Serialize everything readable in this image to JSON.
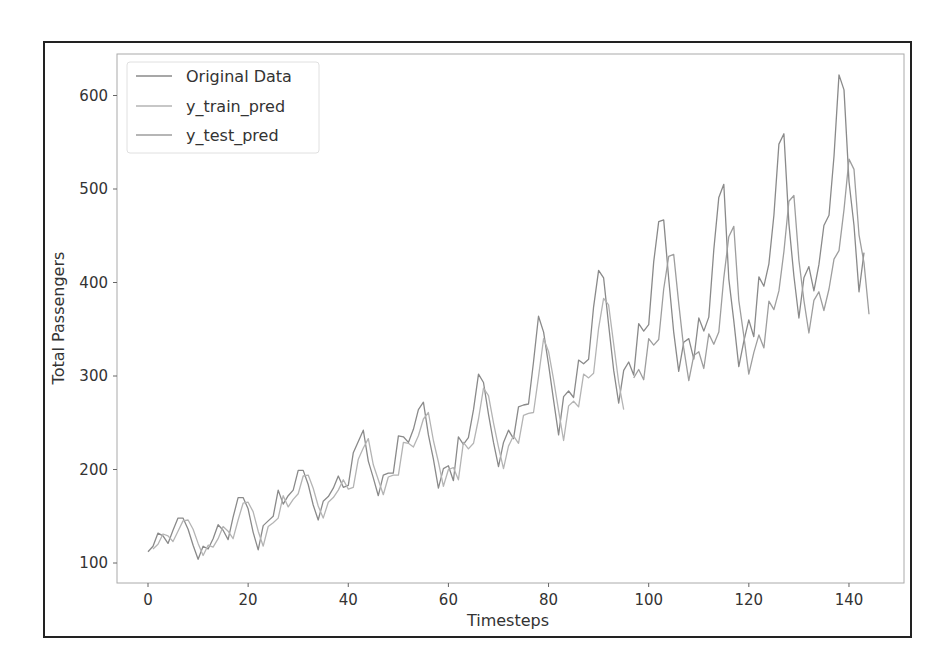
{
  "chart_data": {
    "type": "line",
    "title": "",
    "xlabel": "Timesteps",
    "ylabel": "Total Passengers",
    "xlim": [
      -7.5,
      151
    ],
    "ylim": [
      75,
      645
    ],
    "xticks": [
      0,
      20,
      40,
      60,
      80,
      100,
      120,
      140
    ],
    "yticks": [
      100,
      200,
      300,
      400,
      500,
      600
    ],
    "grid": false,
    "legend_position": "upper left",
    "legend": [
      "Original Data",
      "y_train_pred",
      "y_test_pred"
    ],
    "series": [
      {
        "name": "Original Data",
        "color": "#8a8a8a",
        "x_start": 0,
        "values": [
          112,
          118,
          132,
          129,
          121,
          135,
          148,
          148,
          136,
          119,
          104,
          118,
          115,
          126,
          141,
          135,
          125,
          149,
          170,
          170,
          158,
          133,
          114,
          140,
          145,
          150,
          178,
          163,
          172,
          178,
          199,
          199,
          184,
          162,
          146,
          166,
          171,
          180,
          193,
          181,
          183,
          218,
          230,
          242,
          209,
          191,
          172,
          194,
          196,
          196,
          236,
          235,
          229,
          243,
          264,
          272,
          237,
          211,
          180,
          201,
          204,
          188,
          235,
          227,
          234,
          264,
          302,
          293,
          259,
          229,
          203,
          229,
          242,
          233,
          267,
          269,
          270,
          315,
          364,
          347,
          312,
          274,
          237,
          278,
          284,
          277,
          317,
          313,
          318,
          374,
          413,
          405,
          355,
          306,
          271,
          306,
          315,
          301,
          356,
          348,
          355,
          422,
          465,
          467,
          404,
          347,
          305,
          336,
          340,
          318,
          362,
          348,
          363,
          435,
          491,
          505,
          404,
          359,
          310,
          337,
          360,
          342,
          406,
          396,
          420,
          472,
          548,
          559,
          463,
          407,
          362,
          405,
          417,
          391,
          419,
          461,
          472,
          535,
          622,
          606,
          508,
          461,
          390,
          432
        ]
      },
      {
        "name": "y_train_pred",
        "color": "#b4b4b4",
        "x_start": 1,
        "values": [
          115,
          120,
          131,
          129,
          123,
          134,
          145,
          146,
          136,
          121,
          108,
          119,
          117,
          126,
          139,
          134,
          126,
          146,
          164,
          165,
          155,
          134,
          118,
          139,
          143,
          148,
          172,
          160,
          168,
          174,
          193,
          194,
          180,
          161,
          148,
          165,
          170,
          178,
          189,
          179,
          181,
          211,
          223,
          233,
          205,
          189,
          173,
          192,
          194,
          194,
          229,
          228,
          224,
          236,
          254,
          261,
          231,
          208,
          182,
          200,
          202,
          189,
          229,
          222,
          228,
          254,
          287,
          279,
          250,
          224,
          201,
          225,
          236,
          228,
          258,
          260,
          261,
          299,
          340,
          326,
          296,
          263,
          231,
          268,
          273,
          267,
          302,
          298,
          303,
          351,
          383,
          376,
          334,
          293,
          264
        ]
      },
      {
        "name": "y_test_pred",
        "color": "#9e9e9e",
        "x_start": 97,
        "values": [
          298,
          307,
          296,
          340,
          333,
          339,
          393,
          428,
          430,
          378,
          330,
          295,
          322,
          326,
          308,
          345,
          334,
          347,
          405,
          449,
          460,
          381,
          343,
          302,
          325,
          344,
          330,
          380,
          371,
          391,
          433,
          487,
          493,
          424,
          381,
          346,
          381,
          390,
          370,
          393,
          425,
          434,
          478,
          532,
          521,
          451,
          421,
          366
        ]
      }
    ]
  },
  "axes": {
    "xlabel": "Timesteps",
    "ylabel": "Total Passengers",
    "xtick_labels": [
      "0",
      "20",
      "40",
      "60",
      "80",
      "100",
      "120",
      "140"
    ],
    "ytick_labels": [
      "100",
      "200",
      "300",
      "400",
      "500",
      "600"
    ]
  },
  "legend": {
    "items": [
      {
        "label": "Original Data",
        "color": "#8a8a8a"
      },
      {
        "label": "y_train_pred",
        "color": "#b4b4b4"
      },
      {
        "label": "y_test_pred",
        "color": "#9e9e9e"
      }
    ]
  }
}
